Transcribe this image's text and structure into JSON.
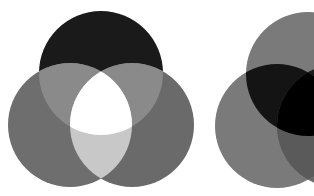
{
  "diagrams": [
    {
      "name": "additive-light-venn",
      "circles": [
        {
          "name": "top",
          "cx": 101,
          "cy": 73,
          "r": 62,
          "color": "#1a1a1a"
        },
        {
          "name": "left",
          "cx": 70,
          "cy": 125,
          "r": 62,
          "color": "#6e6e6e"
        },
        {
          "name": "right",
          "cx": 132,
          "cy": 125,
          "r": 62,
          "color": "#6a6a6a"
        }
      ],
      "overlaps": {
        "top_left": "#8a8a8a",
        "top_right": "#8a8a8a",
        "left_right": "#c8c8c8",
        "center": "#ffffff"
      }
    },
    {
      "name": "subtractive-pigment-venn",
      "circles": [
        {
          "name": "top",
          "cx": 308,
          "cy": 74,
          "r": 62,
          "color": "#7a7a7a"
        },
        {
          "name": "left",
          "cx": 277,
          "cy": 126,
          "r": 62,
          "color": "#7a7a7a"
        },
        {
          "name": "right",
          "cx": 339,
          "cy": 126,
          "r": 62,
          "color": "#6a6a6a"
        }
      ],
      "overlaps": {
        "top_left": "#141414",
        "left_right": "#5a5a5a",
        "center": "#000000"
      }
    }
  ]
}
